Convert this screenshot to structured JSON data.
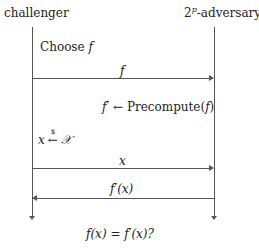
{
  "diagram": {
    "type": "protocol-sequence",
    "parties": {
      "left": {
        "label": "challenger"
      },
      "right": {
        "label_base": "2",
        "label_sup": "p",
        "label_rest": "-adversary"
      }
    },
    "steps": [
      {
        "kind": "action",
        "party": "left",
        "text_prefix": "Choose ",
        "text_math": "f"
      },
      {
        "kind": "message",
        "direction": "left-to-right",
        "label": "f"
      },
      {
        "kind": "action",
        "party": "right",
        "lhs": "f′",
        "arrow": "←",
        "rhs_prefix": "Precompute(",
        "rhs_math": "f",
        "rhs_suffix": ")"
      },
      {
        "kind": "action",
        "party": "left",
        "lhs": "x",
        "arrow": "←",
        "arrow_sup": "$",
        "rhs": "𝒳"
      },
      {
        "kind": "message",
        "direction": "left-to-right",
        "label": "x"
      },
      {
        "kind": "message",
        "direction": "right-to-left",
        "label": "f′(x)"
      },
      {
        "kind": "check",
        "text": "f(x) = f′(x)?"
      }
    ],
    "colors": {
      "line": "#555555",
      "text": "#222222",
      "background": "#ffffff"
    }
  }
}
